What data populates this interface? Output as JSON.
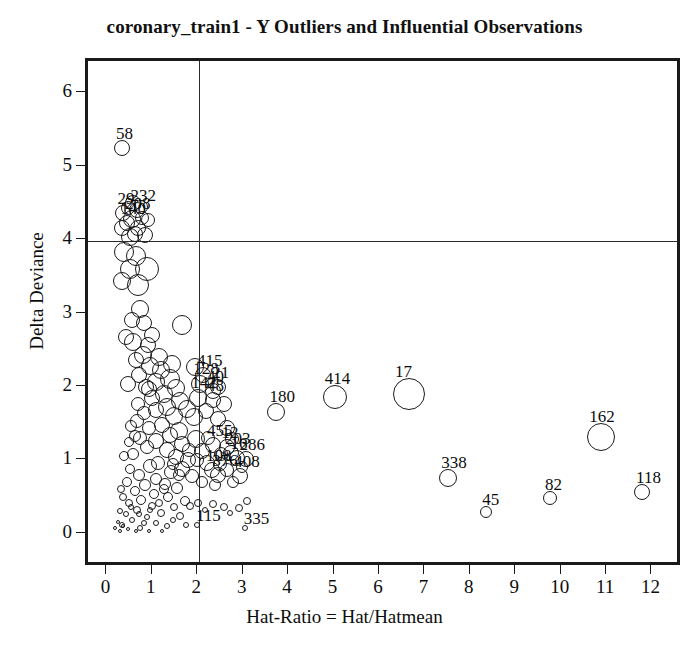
{
  "chart_data": {
    "type": "scatter",
    "title": "coronary_train1 - Y Outliers and Influential Observations",
    "xlabel": "Hat-Ratio = Hat/Hatmean",
    "ylabel": "Delta Deviance",
    "xlim": [
      -0.45,
      12.65
    ],
    "ylim": [
      -0.45,
      6.45
    ],
    "xticks": [
      0,
      1,
      2,
      3,
      4,
      5,
      6,
      7,
      8,
      9,
      10,
      11,
      12
    ],
    "xtick_labels": [
      "0",
      "1",
      "2",
      "3",
      "4",
      "5",
      "6",
      "7",
      "8",
      "9",
      "10",
      "11",
      "12"
    ],
    "yticks": [
      0,
      1,
      2,
      3,
      4,
      5,
      6
    ],
    "ytick_labels": [
      "0",
      "1",
      "2",
      "3",
      "4",
      "5",
      "6"
    ],
    "grid": false,
    "legend": "none",
    "marker": "open-circle",
    "marker_note": "circle radius encodes a third variable (e.g. absolute standardized residual / case weight)",
    "reference_lines": [
      {
        "name": "hat-ratio-threshold",
        "axis": "x",
        "value": 2
      },
      {
        "name": "delta-deviance-threshold",
        "axis": "y",
        "value": 4
      }
    ],
    "labeled_points": [
      {
        "label": "58",
        "x": 0.3,
        "y": 5.27,
        "r": 8
      },
      {
        "label": "29",
        "x": 0.33,
        "y": 4.38,
        "r": 8
      },
      {
        "label": "232",
        "x": 0.62,
        "y": 4.42,
        "r": 8
      },
      {
        "label": "208",
        "x": 0.52,
        "y": 4.3,
        "r": 9
      },
      {
        "label": "140",
        "x": 0.4,
        "y": 4.24,
        "r": 8
      },
      {
        "label": "415",
        "x": 2.08,
        "y": 2.18,
        "r": 8
      },
      {
        "label": "128",
        "x": 2.02,
        "y": 2.05,
        "r": 9
      },
      {
        "label": "21",
        "x": 2.42,
        "y": 2.02,
        "r": 8
      },
      {
        "label": "40",
        "x": 2.3,
        "y": 1.96,
        "r": 8
      },
      {
        "label": "142",
        "x": 1.98,
        "y": 1.86,
        "r": 9
      },
      {
        "label": "48",
        "x": 2.3,
        "y": 1.84,
        "r": 8
      },
      {
        "label": "180",
        "x": 3.7,
        "y": 1.67,
        "r": 9
      },
      {
        "label": "414",
        "x": 4.98,
        "y": 1.88,
        "r": 12
      },
      {
        "label": "17",
        "x": 6.62,
        "y": 1.92,
        "r": 16
      },
      {
        "label": "162",
        "x": 10.85,
        "y": 1.33,
        "r": 14
      },
      {
        "label": "455",
        "x": 2.3,
        "y": 1.22,
        "r": 8
      },
      {
        "label": "12",
        "x": 2.62,
        "y": 1.2,
        "r": 8
      },
      {
        "label": "203",
        "x": 2.7,
        "y": 1.12,
        "r": 8
      },
      {
        "label": "16",
        "x": 2.82,
        "y": 1.05,
        "r": 8
      },
      {
        "label": "286",
        "x": 3.02,
        "y": 1.04,
        "r": 8
      },
      {
        "label": "108",
        "x": 2.28,
        "y": 0.88,
        "r": 8
      },
      {
        "label": "376",
        "x": 2.42,
        "y": 0.82,
        "r": 8
      },
      {
        "label": "408",
        "x": 2.9,
        "y": 0.8,
        "r": 8
      },
      {
        "label": "338",
        "x": 7.48,
        "y": 0.78,
        "r": 9
      },
      {
        "label": "45",
        "x": 8.32,
        "y": 0.31,
        "r": 6
      },
      {
        "label": "82",
        "x": 9.72,
        "y": 0.5,
        "r": 7
      },
      {
        "label": "118",
        "x": 11.75,
        "y": 0.59,
        "r": 8
      },
      {
        "label": "115",
        "x": 1.95,
        "y": 0.13,
        "r": 3
      },
      {
        "label": "335",
        "x": 3.0,
        "y": 0.1,
        "r": 3
      }
    ],
    "unlabeled_points": [
      {
        "x": 0.55,
        "y": 4.52,
        "r": 8
      },
      {
        "x": 0.72,
        "y": 4.46,
        "r": 7
      },
      {
        "x": 0.44,
        "y": 4.45,
        "r": 7
      },
      {
        "x": 0.3,
        "y": 4.18,
        "r": 8
      },
      {
        "x": 0.58,
        "y": 4.1,
        "r": 8
      },
      {
        "x": 0.74,
        "y": 4.32,
        "r": 7
      },
      {
        "x": 0.66,
        "y": 4.18,
        "r": 8
      },
      {
        "x": 0.48,
        "y": 4.05,
        "r": 9
      },
      {
        "x": 0.86,
        "y": 4.28,
        "r": 7
      },
      {
        "x": 0.8,
        "y": 4.08,
        "r": 8
      },
      {
        "x": 0.35,
        "y": 3.85,
        "r": 10
      },
      {
        "x": 0.6,
        "y": 3.8,
        "r": 10
      },
      {
        "x": 0.48,
        "y": 3.62,
        "r": 10
      },
      {
        "x": 0.85,
        "y": 3.62,
        "r": 12
      },
      {
        "x": 0.3,
        "y": 3.45,
        "r": 9
      },
      {
        "x": 0.64,
        "y": 3.4,
        "r": 11
      },
      {
        "x": 0.52,
        "y": 2.92,
        "r": 8
      },
      {
        "x": 1.62,
        "y": 2.86,
        "r": 10
      },
      {
        "x": 0.55,
        "y": 2.62,
        "r": 9
      },
      {
        "x": 0.86,
        "y": 2.58,
        "r": 8
      },
      {
        "x": 0.75,
        "y": 2.45,
        "r": 9
      },
      {
        "x": 0.6,
        "y": 2.38,
        "r": 8
      },
      {
        "x": 0.92,
        "y": 2.3,
        "r": 9
      },
      {
        "x": 1.15,
        "y": 2.24,
        "r": 9
      },
      {
        "x": 0.68,
        "y": 2.18,
        "r": 8
      },
      {
        "x": 1.35,
        "y": 2.12,
        "r": 10
      },
      {
        "x": 1.05,
        "y": 2.08,
        "r": 9
      },
      {
        "x": 0.82,
        "y": 2.02,
        "r": 8
      },
      {
        "x": 1.48,
        "y": 2.0,
        "r": 9
      },
      {
        "x": 1.22,
        "y": 1.92,
        "r": 9
      },
      {
        "x": 0.95,
        "y": 1.86,
        "r": 8
      },
      {
        "x": 1.58,
        "y": 1.82,
        "r": 9
      },
      {
        "x": 1.3,
        "y": 1.74,
        "r": 9
      },
      {
        "x": 1.05,
        "y": 1.7,
        "r": 8
      },
      {
        "x": 0.78,
        "y": 1.66,
        "r": 7
      },
      {
        "x": 1.45,
        "y": 1.62,
        "r": 9
      },
      {
        "x": 1.72,
        "y": 1.72,
        "r": 9
      },
      {
        "x": 1.88,
        "y": 1.6,
        "r": 9
      },
      {
        "x": 0.62,
        "y": 1.55,
        "r": 7
      },
      {
        "x": 1.18,
        "y": 1.5,
        "r": 8
      },
      {
        "x": 0.9,
        "y": 1.46,
        "r": 7
      },
      {
        "x": 1.55,
        "y": 1.42,
        "r": 9
      },
      {
        "x": 1.35,
        "y": 1.36,
        "r": 8
      },
      {
        "x": 0.7,
        "y": 1.32,
        "r": 7
      },
      {
        "x": 1.05,
        "y": 1.28,
        "r": 8
      },
      {
        "x": 1.92,
        "y": 1.3,
        "r": 9
      },
      {
        "x": 1.62,
        "y": 1.24,
        "r": 8
      },
      {
        "x": 0.84,
        "y": 1.2,
        "r": 7
      },
      {
        "x": 1.28,
        "y": 1.16,
        "r": 8
      },
      {
        "x": 2.05,
        "y": 1.14,
        "r": 8
      },
      {
        "x": 0.55,
        "y": 1.1,
        "r": 6
      },
      {
        "x": 1.48,
        "y": 1.06,
        "r": 8
      },
      {
        "x": 1.75,
        "y": 1.02,
        "r": 8
      },
      {
        "x": 1.1,
        "y": 0.98,
        "r": 7
      },
      {
        "x": 0.92,
        "y": 0.94,
        "r": 7
      },
      {
        "x": 1.62,
        "y": 0.9,
        "r": 8
      },
      {
        "x": 1.38,
        "y": 0.86,
        "r": 7
      },
      {
        "x": 0.68,
        "y": 0.82,
        "r": 6
      },
      {
        "x": 2.18,
        "y": 0.98,
        "r": 8
      },
      {
        "x": 2.45,
        "y": 0.96,
        "r": 7
      },
      {
        "x": 1.85,
        "y": 0.8,
        "r": 7
      },
      {
        "x": 1.05,
        "y": 0.76,
        "r": 6
      },
      {
        "x": 1.25,
        "y": 0.7,
        "r": 6
      },
      {
        "x": 0.8,
        "y": 0.68,
        "r": 6
      },
      {
        "x": 1.52,
        "y": 0.64,
        "r": 6
      },
      {
        "x": 0.58,
        "y": 0.6,
        "r": 5
      },
      {
        "x": 1.0,
        "y": 0.56,
        "r": 5
      },
      {
        "x": 1.32,
        "y": 0.52,
        "r": 5
      },
      {
        "x": 0.72,
        "y": 0.48,
        "r": 5
      },
      {
        "x": 1.68,
        "y": 0.46,
        "r": 5
      },
      {
        "x": 0.45,
        "y": 0.44,
        "r": 4
      },
      {
        "x": 0.95,
        "y": 0.4,
        "r": 4
      },
      {
        "x": 1.45,
        "y": 0.38,
        "r": 4
      },
      {
        "x": 0.62,
        "y": 0.34,
        "r": 4
      },
      {
        "x": 1.15,
        "y": 0.3,
        "r": 4
      },
      {
        "x": 0.38,
        "y": 0.28,
        "r": 3
      },
      {
        "x": 0.85,
        "y": 0.24,
        "r": 3
      },
      {
        "x": 1.58,
        "y": 0.26,
        "r": 4
      },
      {
        "x": 0.52,
        "y": 0.2,
        "r": 3
      },
      {
        "x": 1.05,
        "y": 0.16,
        "r": 3
      },
      {
        "x": 0.3,
        "y": 0.14,
        "r": 3
      },
      {
        "x": 0.7,
        "y": 0.1,
        "r": 3
      },
      {
        "x": 1.3,
        "y": 0.12,
        "r": 3
      },
      {
        "x": 0.42,
        "y": 0.08,
        "r": 2
      },
      {
        "x": 0.9,
        "y": 0.06,
        "r": 2
      },
      {
        "x": 0.25,
        "y": 0.32,
        "r": 3
      },
      {
        "x": 0.33,
        "y": 0.52,
        "r": 4
      },
      {
        "x": 0.4,
        "y": 0.72,
        "r": 5
      },
      {
        "x": 0.48,
        "y": 0.9,
        "r": 5
      },
      {
        "x": 0.28,
        "y": 0.62,
        "r": 4
      },
      {
        "x": 0.2,
        "y": 0.18,
        "r": 2
      },
      {
        "x": 0.58,
        "y": 1.34,
        "r": 6
      },
      {
        "x": 0.35,
        "y": 1.08,
        "r": 5
      },
      {
        "x": 0.45,
        "y": 1.26,
        "r": 5
      },
      {
        "x": 0.5,
        "y": 1.48,
        "r": 6
      },
      {
        "x": 0.65,
        "y": 1.78,
        "r": 7
      },
      {
        "x": 2.62,
        "y": 0.88,
        "r": 7
      },
      {
        "x": 2.2,
        "y": 1.32,
        "r": 7
      },
      {
        "x": 2.48,
        "y": 1.1,
        "r": 7
      },
      {
        "x": 2.05,
        "y": 0.72,
        "r": 6
      },
      {
        "x": 2.35,
        "y": 0.68,
        "r": 6
      },
      {
        "x": 2.75,
        "y": 0.72,
        "r": 6
      },
      {
        "x": 1.98,
        "y": 0.44,
        "r": 4
      },
      {
        "x": 2.3,
        "y": 0.42,
        "r": 4
      },
      {
        "x": 2.55,
        "y": 0.38,
        "r": 4
      },
      {
        "x": 2.88,
        "y": 0.36,
        "r": 4
      },
      {
        "x": 1.8,
        "y": 0.4,
        "r": 4
      },
      {
        "x": 2.12,
        "y": 0.34,
        "r": 3
      },
      {
        "x": 2.68,
        "y": 0.3,
        "r": 3
      },
      {
        "x": 3.05,
        "y": 0.46,
        "r": 4
      },
      {
        "x": 2.42,
        "y": 1.58,
        "r": 8
      },
      {
        "x": 2.15,
        "y": 1.68,
        "r": 8
      },
      {
        "x": 2.6,
        "y": 1.46,
        "r": 8
      },
      {
        "x": 1.9,
        "y": 2.28,
        "r": 9
      },
      {
        "x": 2.55,
        "y": 1.78,
        "r": 8
      },
      {
        "x": 0.25,
        "y": 0.05,
        "r": 2
      },
      {
        "x": 0.33,
        "y": 0.12,
        "r": 2
      },
      {
        "x": 0.6,
        "y": 0.05,
        "r": 2
      },
      {
        "x": 0.78,
        "y": 0.16,
        "r": 3
      },
      {
        "x": 1.18,
        "y": 0.06,
        "r": 2
      },
      {
        "x": 1.42,
        "y": 0.2,
        "r": 3
      },
      {
        "x": 1.7,
        "y": 0.14,
        "r": 3
      },
      {
        "x": 0.15,
        "y": 0.1,
        "r": 2
      },
      {
        "x": 0.92,
        "y": 0.34,
        "r": 3
      },
      {
        "x": 1.12,
        "y": 0.44,
        "r": 4
      },
      {
        "x": 1.22,
        "y": 0.62,
        "r": 5
      },
      {
        "x": 0.5,
        "y": 0.38,
        "r": 3
      },
      {
        "x": 0.68,
        "y": 0.28,
        "r": 3
      },
      {
        "x": 1.55,
        "y": 0.82,
        "r": 6
      },
      {
        "x": 1.42,
        "y": 0.96,
        "r": 6
      },
      {
        "x": 1.78,
        "y": 1.16,
        "r": 7
      },
      {
        "x": 1.95,
        "y": 1.02,
        "r": 7
      },
      {
        "x": 0.42,
        "y": 2.05,
        "r": 8
      },
      {
        "x": 0.38,
        "y": 2.7,
        "r": 8
      },
      {
        "x": 0.95,
        "y": 2.72,
        "r": 8
      },
      {
        "x": 0.7,
        "y": 3.08,
        "r": 9
      },
      {
        "x": 0.9,
        "y": 1.98,
        "r": 8
      },
      {
        "x": 1.12,
        "y": 2.42,
        "r": 9
      },
      {
        "x": 1.4,
        "y": 2.32,
        "r": 9
      },
      {
        "x": 0.78,
        "y": 2.88,
        "r": 8
      },
      {
        "x": 2.72,
        "y": 1.3,
        "r": 7
      },
      {
        "x": 2.95,
        "y": 0.92,
        "r": 6
      }
    ]
  }
}
